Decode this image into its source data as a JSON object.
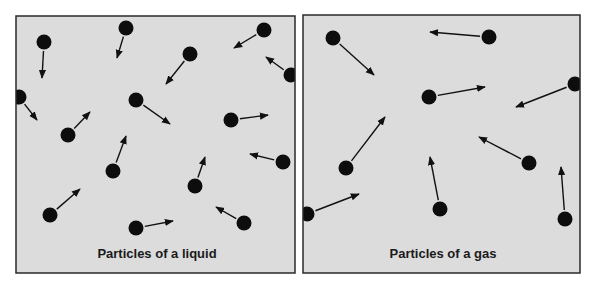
{
  "colors": {
    "panel_fill": "#dcdcdc",
    "panel_border": "#2a2a2a",
    "particle": "#0d0d0d",
    "arrow": "#111111"
  },
  "panels": [
    {
      "id": "liquid",
      "caption": "Particles of a liquid",
      "rect": [
        16,
        16,
        279,
        257
      ],
      "caption_pos": [
        157,
        258
      ],
      "particles": [
        {
          "c": [
            44,
            42
          ],
          "a": [
            42,
            78
          ]
        },
        {
          "c": [
            126,
            28
          ],
          "a": [
            117,
            58
          ]
        },
        {
          "c": [
            190,
            54
          ],
          "a": [
            166,
            84
          ]
        },
        {
          "c": [
            264,
            30
          ],
          "a": [
            234,
            48
          ]
        },
        {
          "c": [
            291,
            75
          ],
          "a": [
            266,
            57
          ]
        },
        {
          "c": [
            19,
            97
          ],
          "a": [
            37,
            120
          ]
        },
        {
          "c": [
            136,
            100
          ],
          "a": [
            170,
            124
          ]
        },
        {
          "c": [
            231,
            120
          ],
          "a": [
            268,
            115
          ]
        },
        {
          "c": [
            68,
            135
          ],
          "a": [
            90,
            112
          ]
        },
        {
          "c": [
            113,
            171
          ],
          "a": [
            126,
            136
          ]
        },
        {
          "c": [
            283,
            162
          ],
          "a": [
            250,
            154
          ]
        },
        {
          "c": [
            195,
            186
          ],
          "a": [
            205,
            157
          ]
        },
        {
          "c": [
            50,
            215
          ],
          "a": [
            80,
            189
          ]
        },
        {
          "c": [
            136,
            228
          ],
          "a": [
            173,
            221
          ]
        },
        {
          "c": [
            244,
            223
          ],
          "a": [
            216,
            207
          ]
        }
      ]
    },
    {
      "id": "gas",
      "caption": "Particles of a gas",
      "rect": [
        303,
        15,
        277,
        258
      ],
      "caption_pos": [
        443,
        258
      ],
      "particles": [
        {
          "c": [
            333,
            38
          ],
          "a": [
            374,
            75
          ]
        },
        {
          "c": [
            489,
            37
          ],
          "a": [
            430,
            32
          ]
        },
        {
          "c": [
            429,
            97
          ],
          "a": [
            485,
            87
          ]
        },
        {
          "c": [
            575,
            84
          ],
          "a": [
            516,
            107
          ]
        },
        {
          "c": [
            346,
            168
          ],
          "a": [
            385,
            117
          ]
        },
        {
          "c": [
            529,
            163
          ],
          "a": [
            479,
            137
          ]
        },
        {
          "c": [
            440,
            209
          ],
          "a": [
            430,
            157
          ]
        },
        {
          "c": [
            307,
            214
          ],
          "a": [
            359,
            194
          ]
        },
        {
          "c": [
            565,
            219
          ],
          "a": [
            561,
            167
          ]
        }
      ]
    }
  ]
}
